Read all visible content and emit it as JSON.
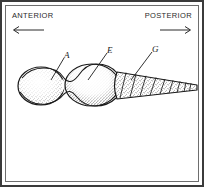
{
  "figure": {
    "caption_present": false,
    "orientation": {
      "anterior": {
        "text": "ANTERIOR",
        "arrow": "left-arrow-icon",
        "direction": "left"
      },
      "posterior": {
        "text": "POSTERIOR",
        "arrow": "right-arrow-icon",
        "direction": "right"
      }
    },
    "labels": [
      {
        "id": "A",
        "text": "A",
        "target": "anterior-bulb"
      },
      {
        "id": "E",
        "text": "E",
        "target": "middle-bulb"
      },
      {
        "id": "G",
        "text": "G",
        "target": "segmented-trunk"
      }
    ],
    "colors": {
      "border": "#3b3b3b",
      "inner_frame": "#6e6e6e",
      "ink": "#1a1a1a",
      "background": "#ffffff",
      "stipple": "#2b2b2b"
    }
  }
}
